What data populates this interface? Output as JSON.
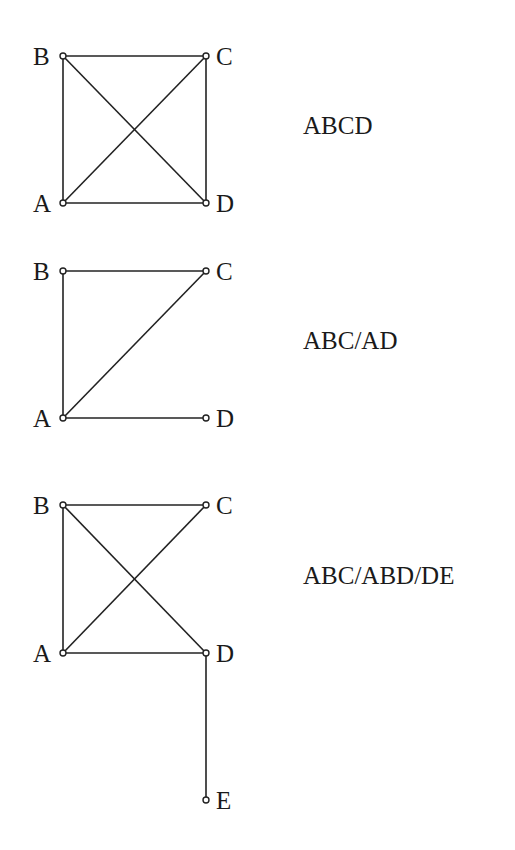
{
  "figure": {
    "background": "#ffffff",
    "line_color": "#222222",
    "diagrams": [
      {
        "model_label": "ABCD",
        "label_pos": [
          303,
          113
        ],
        "vertices": [
          {
            "id": "A",
            "x": 63,
            "y": 203,
            "label_side": "left"
          },
          {
            "id": "B",
            "x": 63,
            "y": 56,
            "label_side": "left"
          },
          {
            "id": "C",
            "x": 206,
            "y": 56,
            "label_side": "right"
          },
          {
            "id": "D",
            "x": 206,
            "y": 203,
            "label_side": "right"
          }
        ],
        "edges": [
          [
            "A",
            "B"
          ],
          [
            "B",
            "C"
          ],
          [
            "C",
            "D"
          ],
          [
            "A",
            "D"
          ],
          [
            "A",
            "C"
          ],
          [
            "B",
            "D"
          ]
        ]
      },
      {
        "model_label": "ABC/AD",
        "label_pos": [
          303,
          328
        ],
        "vertices": [
          {
            "id": "A",
            "x": 63,
            "y": 418,
            "label_side": "left"
          },
          {
            "id": "B",
            "x": 63,
            "y": 271,
            "label_side": "left"
          },
          {
            "id": "C",
            "x": 206,
            "y": 271,
            "label_side": "right"
          },
          {
            "id": "D",
            "x": 206,
            "y": 418,
            "label_side": "right"
          }
        ],
        "edges": [
          [
            "A",
            "B"
          ],
          [
            "B",
            "C"
          ],
          [
            "A",
            "C"
          ],
          [
            "A",
            "D"
          ]
        ]
      },
      {
        "model_label": "ABC/ABD/DE",
        "label_pos": [
          303,
          563
        ],
        "vertices": [
          {
            "id": "A",
            "x": 63,
            "y": 653,
            "label_side": "left"
          },
          {
            "id": "B",
            "x": 63,
            "y": 505,
            "label_side": "left"
          },
          {
            "id": "C",
            "x": 206,
            "y": 505,
            "label_side": "right"
          },
          {
            "id": "D",
            "x": 206,
            "y": 653,
            "label_side": "right"
          },
          {
            "id": "E",
            "x": 206,
            "y": 800,
            "label_side": "right"
          }
        ],
        "edges": [
          [
            "A",
            "B"
          ],
          [
            "B",
            "C"
          ],
          [
            "A",
            "C"
          ],
          [
            "B",
            "D"
          ],
          [
            "A",
            "D"
          ],
          [
            "D",
            "E"
          ]
        ]
      }
    ]
  }
}
